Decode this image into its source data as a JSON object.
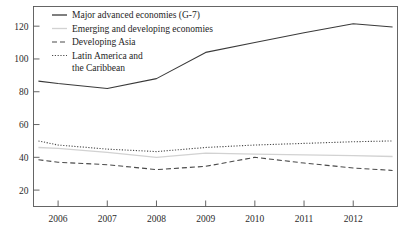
{
  "chart_data": {
    "type": "line",
    "title": "",
    "xlabel": "",
    "ylabel": "",
    "xlim": [
      2005.5,
      2012.9
    ],
    "ylim": [
      10,
      132
    ],
    "grid": false,
    "legend_position": "top-left-inside",
    "x": [
      2005.6,
      2006,
      2007,
      2008,
      2009,
      2010,
      2011,
      2012,
      2012.8
    ],
    "xtick_labels": [
      "2006",
      "2007",
      "2008",
      "2009",
      "2010",
      "2011",
      "2012"
    ],
    "xticks": [
      2006,
      2007,
      2008,
      2009,
      2010,
      2011,
      2012
    ],
    "ytick_labels": [
      "20",
      "40",
      "60",
      "80",
      "100",
      "120"
    ],
    "yticks": [
      20,
      40,
      60,
      80,
      100,
      120
    ],
    "series": [
      {
        "name": "Major advanced economies (G-7)",
        "style": "solid",
        "color": "#3a3a3a",
        "width": 1.1,
        "values": [
          86.5,
          85.0,
          82.0,
          88.0,
          104.0,
          110.0,
          116.0,
          121.5,
          119.5
        ]
      },
      {
        "name": "Emerging and developing economies",
        "style": "solid",
        "color": "#d2d2d2",
        "width": 1.3,
        "values": [
          46.0,
          45.5,
          43.0,
          40.0,
          42.5,
          42.0,
          41.5,
          41.0,
          40.5
        ]
      },
      {
        "name": "Developing Asia",
        "style": "dashed",
        "color": "#4a4a4a",
        "width": 1.1,
        "values": [
          38.5,
          37.0,
          35.5,
          32.5,
          34.5,
          40.0,
          36.5,
          33.5,
          32.0
        ]
      },
      {
        "name": "Latin America and the Caribbean",
        "style": "dotted",
        "color": "#4a4a4a",
        "width": 1.1,
        "values": [
          50.0,
          47.5,
          45.0,
          43.5,
          46.0,
          47.5,
          48.5,
          49.5,
          50.0
        ]
      }
    ],
    "legend_entries": [
      {
        "label": "Major advanced economies (G-7)",
        "style": "solid",
        "color": "#3a3a3a"
      },
      {
        "label": "Emerging and developing economies",
        "style": "solid",
        "color": "#d2d2d2"
      },
      {
        "label": "Developing Asia",
        "style": "dashed",
        "color": "#4a4a4a"
      },
      {
        "label": "Latin America and",
        "label2": "the Caribbean",
        "style": "dotted",
        "color": "#4a4a4a"
      }
    ]
  }
}
